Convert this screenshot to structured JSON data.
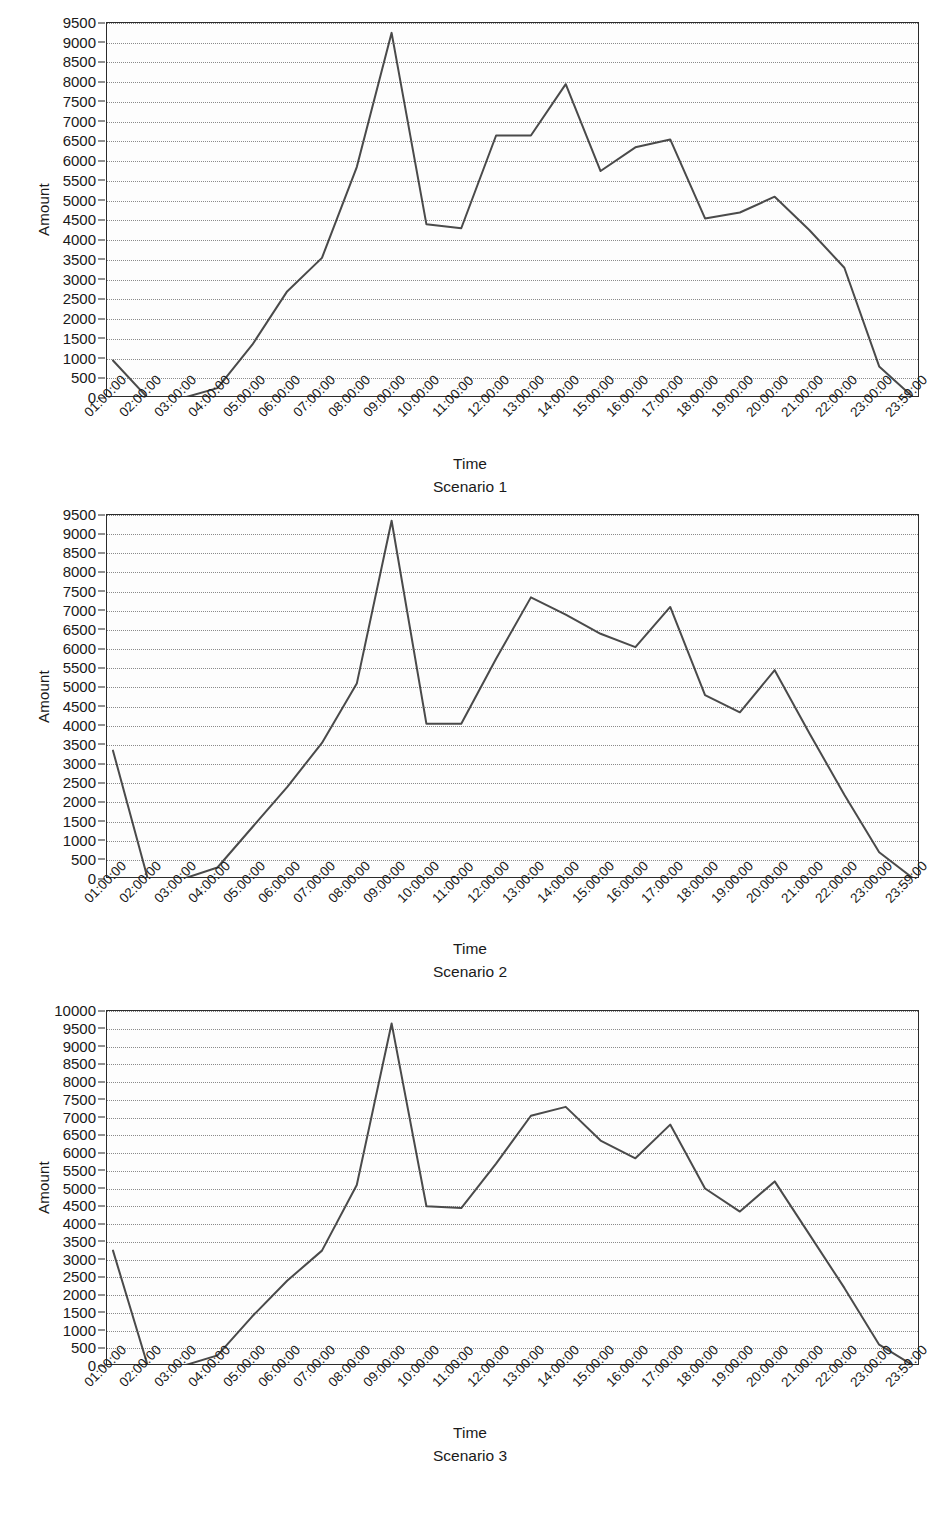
{
  "page": {
    "background": "#ffffff",
    "line_color": "#4a4a4a",
    "axis_color": "#2b2b2b",
    "grid_color": "#8a8a8a"
  },
  "common": {
    "xlabel": "Time",
    "ylabel": "Amount",
    "categories": [
      "01:00:00",
      "02:00:00",
      "03:00:00",
      "04:00:00",
      "05:00:00",
      "06:00:00",
      "07:00:00",
      "08:00:00",
      "09:00:00",
      "10:00:00",
      "11:00:00",
      "12:00:00",
      "13:00:00",
      "14:00:00",
      "15:00:00",
      "16:00:00",
      "17:00:00",
      "18:00:00",
      "19:00:00",
      "20:00:00",
      "21:00:00",
      "22:00:00",
      "23:00:00",
      "23:59:00"
    ]
  },
  "charts": [
    {
      "caption": "Scenario 1",
      "xlabel": "Time",
      "ylabel": "Amount",
      "yticks": [
        0,
        500,
        1000,
        1500,
        2000,
        2500,
        3000,
        3500,
        4000,
        4500,
        5000,
        5500,
        6000,
        6500,
        7000,
        7500,
        8000,
        8500,
        9000,
        9500
      ],
      "ylim": [
        0,
        9500
      ]
    },
    {
      "caption": "Scenario 2",
      "xlabel": "Time",
      "ylabel": "Amount",
      "yticks": [
        0,
        500,
        1000,
        1500,
        2000,
        2500,
        3000,
        3500,
        4000,
        4500,
        5000,
        5500,
        6000,
        6500,
        7000,
        7500,
        8000,
        8500,
        9000,
        9500
      ],
      "ylim": [
        0,
        9500
      ]
    },
    {
      "caption": "Scenario 3",
      "xlabel": "Time",
      "ylabel": "Amount",
      "yticks": [
        0,
        500,
        1000,
        1500,
        2000,
        2500,
        3000,
        3500,
        4000,
        4500,
        5000,
        5500,
        6000,
        6500,
        7000,
        7500,
        8000,
        8500,
        9000,
        9500,
        10000
      ],
      "ylim": [
        0,
        10000
      ]
    }
  ],
  "chart_data": [
    {
      "type": "line",
      "title": "Scenario 1",
      "xlabel": "Time",
      "ylabel": "Amount",
      "ylim": [
        0,
        9500
      ],
      "grid": true,
      "legend": "none",
      "categories": [
        "01:00:00",
        "02:00:00",
        "03:00:00",
        "04:00:00",
        "05:00:00",
        "06:00:00",
        "07:00:00",
        "08:00:00",
        "09:00:00",
        "10:00:00",
        "11:00:00",
        "12:00:00",
        "13:00:00",
        "14:00:00",
        "15:00:00",
        "16:00:00",
        "17:00:00",
        "18:00:00",
        "19:00:00",
        "20:00:00",
        "21:00:00",
        "22:00:00",
        "23:00:00",
        "23:59:00"
      ],
      "values": [
        950,
        0,
        0,
        250,
        1350,
        2700,
        3550,
        5850,
        9250,
        4400,
        4300,
        6650,
        6650,
        7950,
        5750,
        6350,
        6550,
        4550,
        4700,
        5100,
        4250,
        3300,
        800,
        0
      ]
    },
    {
      "type": "line",
      "title": "Scenario 2",
      "xlabel": "Time",
      "ylabel": "Amount",
      "ylim": [
        0,
        9500
      ],
      "grid": true,
      "legend": "none",
      "categories": [
        "01:00:00",
        "02:00:00",
        "03:00:00",
        "04:00:00",
        "05:00:00",
        "06:00:00",
        "07:00:00",
        "08:00:00",
        "09:00:00",
        "10:00:00",
        "11:00:00",
        "12:00:00",
        "13:00:00",
        "14:00:00",
        "15:00:00",
        "16:00:00",
        "17:00:00",
        "18:00:00",
        "19:00:00",
        "20:00:00",
        "21:00:00",
        "22:00:00",
        "23:00:00",
        "23:59:00"
      ],
      "values": [
        3350,
        0,
        0,
        300,
        1350,
        2400,
        3550,
        5100,
        9350,
        4050,
        4050,
        5750,
        7350,
        6900,
        6400,
        6050,
        7100,
        4800,
        4350,
        5450,
        3800,
        2200,
        700,
        0
      ]
    },
    {
      "type": "line",
      "title": "Scenario 3",
      "xlabel": "Time",
      "ylabel": "Amount",
      "ylim": [
        0,
        10000
      ],
      "grid": true,
      "legend": "none",
      "categories": [
        "01:00:00",
        "02:00:00",
        "03:00:00",
        "04:00:00",
        "05:00:00",
        "06:00:00",
        "07:00:00",
        "08:00:00",
        "09:00:00",
        "10:00:00",
        "11:00:00",
        "12:00:00",
        "13:00:00",
        "14:00:00",
        "15:00:00",
        "16:00:00",
        "17:00:00",
        "18:00:00",
        "19:00:00",
        "20:00:00",
        "21:00:00",
        "22:00:00",
        "23:00:00",
        "23:59:00"
      ],
      "values": [
        3250,
        0,
        0,
        300,
        1400,
        2400,
        3250,
        5100,
        9650,
        4500,
        4450,
        5700,
        7050,
        7300,
        6350,
        5850,
        6800,
        5000,
        4350,
        5200,
        3700,
        2200,
        600,
        0
      ]
    }
  ]
}
